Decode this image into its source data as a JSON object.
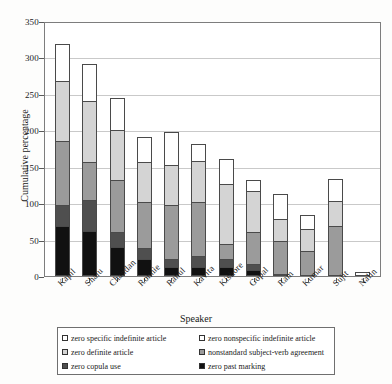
{
  "chart_data": {
    "type": "bar",
    "subtype": "stacked-bar",
    "title": "",
    "xlabel": "Speaker",
    "ylabel": "Cumulative percentage",
    "ylim": [
      0,
      350
    ],
    "yticks": [
      0,
      50,
      100,
      150,
      200,
      250,
      300,
      350
    ],
    "grid": true,
    "legend_position": "bottom",
    "categories": [
      "Kapil",
      "Shalu",
      "Chandan",
      "Ronnie",
      "Rahul",
      "Kavita",
      "Kishore",
      "Gopal",
      "Ram",
      "Kumar",
      "Sujit",
      "Nalin"
    ],
    "series": [
      {
        "name": "zero past marking",
        "color": "#111111",
        "values": [
          68,
          62,
          40,
          23,
          13,
          13,
          12,
          8,
          1,
          0,
          0,
          0
        ]
      },
      {
        "name": "zero copula use",
        "color": "#4f4f4f",
        "values": [
          30,
          43,
          21,
          16,
          11,
          14,
          12,
          8,
          0,
          0,
          0,
          0
        ]
      },
      {
        "name": "nonstandard subject-verb agreement",
        "color": "#9b9b9b",
        "values": [
          88,
          51,
          71,
          62,
          73,
          75,
          20,
          44,
          45,
          35,
          68,
          0
        ]
      },
      {
        "name": "zero definite article",
        "color": "#d4d4d4",
        "values": [
          82,
          84,
          68,
          56,
          55,
          56,
          82,
          57,
          30,
          30,
          35,
          0
        ]
      },
      {
        "name": "zero nonspecific indefinite article",
        "color": "#ffffff",
        "values": [
          50,
          51,
          45,
          34,
          46,
          23,
          34,
          15,
          35,
          19,
          30,
          6
        ]
      },
      {
        "name": "zero specific indefinite article",
        "color": "#ffffff",
        "values": [
          0,
          0,
          0,
          0,
          0,
          0,
          0,
          0,
          0,
          0,
          0,
          0
        ]
      }
    ],
    "totals": [
      318,
      291,
      245,
      191,
      198,
      181,
      160,
      132,
      111,
      84,
      133,
      6
    ]
  },
  "axes": {
    "y_title": "Cumulative percentage",
    "x_title": "Speaker",
    "y_ticks": [
      "0",
      "50",
      "100",
      "150",
      "200",
      "250",
      "300",
      "350"
    ],
    "x_ticks": [
      "Kapil",
      "Shalu",
      "Chandan",
      "Ronnie",
      "Rahul",
      "Kavita",
      "Kishore",
      "Gopal",
      "Ram",
      "Kumar",
      "Sujit",
      "Nalin"
    ]
  },
  "legend": {
    "rows": [
      {
        "left": "zero specific indefinite article",
        "left_color": "#ffffff",
        "right": "zero nonspecific indefinite article",
        "right_color": "#ffffff"
      },
      {
        "left": "zero definite article",
        "left_color": "#d4d4d4",
        "right": "nonstandard subject-verb agreement",
        "right_color": "#9b9b9b"
      },
      {
        "left": "zero copula use",
        "left_color": "#4f4f4f",
        "right": "zero past marking",
        "right_color": "#111111"
      }
    ]
  }
}
